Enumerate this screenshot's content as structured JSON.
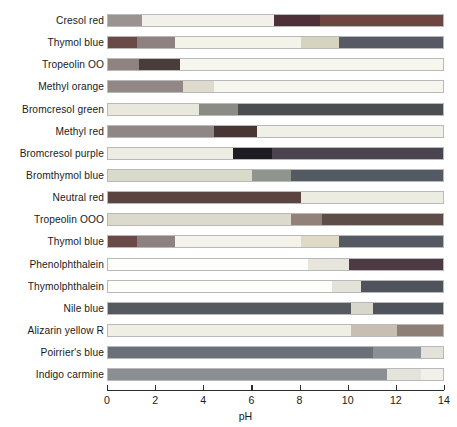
{
  "chart_data": {
    "type": "bar",
    "title": "",
    "xlabel": "pH",
    "ylabel": "",
    "xlim": [
      0,
      14
    ],
    "xticks": [
      0,
      2,
      4,
      6,
      8,
      10,
      12,
      14
    ],
    "xtick_labels": [
      "0",
      "2",
      "4",
      "6",
      "8",
      "10",
      "12",
      "14"
    ],
    "grid": false,
    "legend": "none",
    "categories": [
      "Cresol red",
      "Thymol blue",
      "Tropeolin OO",
      "Methyl orange",
      "Bromcresol green",
      "Methyl red",
      "Bromcresol purple",
      "Bromthymol blue",
      "Neutral red",
      "Tropeolin OOO",
      "Thymol blue",
      "Phenolphthalein",
      "Thymolphthalein",
      "Nile blue",
      "Alizarin yellow R",
      "Poirrier's blue",
      "Indigo carmine"
    ],
    "series": [
      {
        "name": "Cresol red",
        "segments": [
          {
            "start": 0.0,
            "end": 1.4,
            "color": "#9a9391"
          },
          {
            "start": 1.4,
            "end": 6.9,
            "color": "#f2f1e9"
          },
          {
            "start": 6.9,
            "end": 8.8,
            "color": "#4e3138"
          },
          {
            "start": 8.8,
            "end": 14.0,
            "color": "#6d4642"
          }
        ]
      },
      {
        "name": "Thymol blue",
        "segments": [
          {
            "start": 0.0,
            "end": 1.2,
            "color": "#6a4a49"
          },
          {
            "start": 1.2,
            "end": 2.8,
            "color": "#8d8280"
          },
          {
            "start": 2.8,
            "end": 8.0,
            "color": "#f4f3ea"
          },
          {
            "start": 8.0,
            "end": 9.6,
            "color": "#d6d3bf"
          },
          {
            "start": 9.6,
            "end": 14.0,
            "color": "#575a63"
          }
        ]
      },
      {
        "name": "Tropeolin OO",
        "segments": [
          {
            "start": 0.0,
            "end": 1.3,
            "color": "#8e8381"
          },
          {
            "start": 1.3,
            "end": 3.0,
            "color": "#4b3c3c"
          },
          {
            "start": 3.0,
            "end": 14.0,
            "color": "#f6f5ee"
          }
        ]
      },
      {
        "name": "Methyl orange",
        "segments": [
          {
            "start": 0.0,
            "end": 3.1,
            "color": "#938785"
          },
          {
            "start": 3.1,
            "end": 4.4,
            "color": "#dedbcc"
          },
          {
            "start": 4.4,
            "end": 14.0,
            "color": "#f6f5ee"
          }
        ]
      },
      {
        "name": "Bromcresol green",
        "segments": [
          {
            "start": 0.0,
            "end": 3.8,
            "color": "#e9e8dc"
          },
          {
            "start": 3.8,
            "end": 5.4,
            "color": "#8a8b84"
          },
          {
            "start": 5.4,
            "end": 14.0,
            "color": "#4a4e50"
          }
        ]
      },
      {
        "name": "Methyl red",
        "segments": [
          {
            "start": 0.0,
            "end": 4.4,
            "color": "#8f8785"
          },
          {
            "start": 4.4,
            "end": 6.2,
            "color": "#4a3535"
          },
          {
            "start": 6.2,
            "end": 14.0,
            "color": "#f1f0e7"
          }
        ]
      },
      {
        "name": "Bromcresol purple",
        "segments": [
          {
            "start": 0.0,
            "end": 5.2,
            "color": "#eeede3"
          },
          {
            "start": 5.2,
            "end": 6.8,
            "color": "#1f1b22"
          },
          {
            "start": 6.8,
            "end": 14.0,
            "color": "#4a4450"
          }
        ]
      },
      {
        "name": "Bromthymol blue",
        "segments": [
          {
            "start": 0.0,
            "end": 6.0,
            "color": "#d9dac9"
          },
          {
            "start": 6.0,
            "end": 7.6,
            "color": "#8f948d"
          },
          {
            "start": 7.6,
            "end": 14.0,
            "color": "#545a62"
          }
        ]
      },
      {
        "name": "Neutral red",
        "segments": [
          {
            "start": 0.0,
            "end": 8.0,
            "color": "#5a4341"
          },
          {
            "start": 8.0,
            "end": 14.0,
            "color": "#edece2"
          }
        ]
      },
      {
        "name": "Tropeolin OOO",
        "segments": [
          {
            "start": 0.0,
            "end": 7.6,
            "color": "#dcdacb"
          },
          {
            "start": 7.6,
            "end": 8.9,
            "color": "#918179"
          },
          {
            "start": 8.9,
            "end": 14.0,
            "color": "#5d4c48"
          }
        ]
      },
      {
        "name": "Thymol blue",
        "segments": [
          {
            "start": 0.0,
            "end": 1.2,
            "color": "#6a4a49"
          },
          {
            "start": 1.2,
            "end": 2.8,
            "color": "#8d8280"
          },
          {
            "start": 2.8,
            "end": 8.0,
            "color": "#f4f3ea"
          },
          {
            "start": 8.0,
            "end": 9.6,
            "color": "#dedac6"
          },
          {
            "start": 9.6,
            "end": 14.0,
            "color": "#555963"
          }
        ]
      },
      {
        "name": "Phenolphthalein",
        "segments": [
          {
            "start": 0.0,
            "end": 8.3,
            "color": "#fdfdfa"
          },
          {
            "start": 8.3,
            "end": 10.0,
            "color": "#e7e5dc"
          },
          {
            "start": 10.0,
            "end": 14.0,
            "color": "#4c3b44"
          }
        ]
      },
      {
        "name": "Thymolphthalein",
        "segments": [
          {
            "start": 0.0,
            "end": 9.3,
            "color": "#fdfdfa"
          },
          {
            "start": 9.3,
            "end": 10.5,
            "color": "#e4e3da"
          },
          {
            "start": 10.5,
            "end": 14.0,
            "color": "#4f535c"
          }
        ]
      },
      {
        "name": "Nile blue",
        "segments": [
          {
            "start": 0.0,
            "end": 10.1,
            "color": "#555a61"
          },
          {
            "start": 10.1,
            "end": 11.0,
            "color": "#d8d7cc"
          },
          {
            "start": 11.0,
            "end": 14.0,
            "color": "#4f545c"
          }
        ]
      },
      {
        "name": "Alizarin yellow R",
        "segments": [
          {
            "start": 0.0,
            "end": 10.1,
            "color": "#f0efe6"
          },
          {
            "start": 10.1,
            "end": 12.0,
            "color": "#c7c0b2"
          },
          {
            "start": 12.0,
            "end": 14.0,
            "color": "#8e7f76"
          }
        ]
      },
      {
        "name": "Poirrier's blue",
        "segments": [
          {
            "start": 0.0,
            "end": 11.0,
            "color": "#6b6f77"
          },
          {
            "start": 11.0,
            "end": 13.0,
            "color": "#8b8f96"
          },
          {
            "start": 13.0,
            "end": 14.0,
            "color": "#e2e1da"
          }
        ]
      },
      {
        "name": "Indigo carmine",
        "segments": [
          {
            "start": 0.0,
            "end": 11.6,
            "color": "#8b8f94"
          },
          {
            "start": 11.6,
            "end": 13.0,
            "color": "#e4e3dc"
          },
          {
            "start": 13.0,
            "end": 14.0,
            "color": "#f1f0ea"
          }
        ]
      }
    ]
  }
}
